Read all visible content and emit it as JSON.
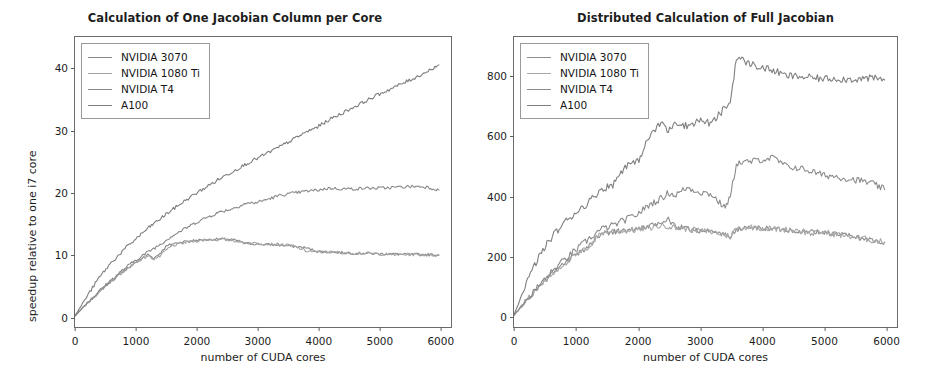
{
  "figure": {
    "background": "#ffffff",
    "panel_count": 2
  },
  "chart_data": [
    {
      "type": "line",
      "panel": "left",
      "title": "Calculation of One Jacobian Column per Core",
      "xlabel": "number of CUDA cores",
      "ylabel": "speedup relative to one i7 core",
      "xlim": [
        0,
        6200
      ],
      "ylim": [
        -1.8,
        45
      ],
      "xticks": [
        0,
        1000,
        2000,
        3000,
        4000,
        5000,
        6000
      ],
      "xticklabels": [
        "0",
        "1000",
        "2000",
        "3000",
        "4000",
        "5000",
        "6000"
      ],
      "yticks": [
        0,
        10,
        20,
        30,
        40
      ],
      "yticklabels": [
        "0",
        "10",
        "20",
        "30",
        "40"
      ],
      "grid": false,
      "legend_position": "upper left",
      "x": [
        0,
        200,
        400,
        600,
        800,
        1000,
        1200,
        1300,
        1400,
        1500,
        1600,
        1800,
        2000,
        2200,
        2400,
        2600,
        2800,
        3000,
        3200,
        3400,
        3600,
        3800,
        4000,
        4200,
        4400,
        4600,
        4800,
        5000,
        5200,
        5400,
        5600,
        5800,
        6000
      ],
      "series": [
        {
          "name": "NVIDIA 3070",
          "color": "#8a8a8a",
          "values": [
            0,
            2.0,
            3.9,
            5.6,
            7.2,
            8.6,
            9.9,
            9.3,
            10.1,
            11.2,
            11.6,
            12.0,
            12.2,
            12.3,
            12.4,
            12.3,
            11.7,
            11.6,
            11.5,
            11.4,
            11.2,
            11.0,
            10.4,
            10.3,
            10.2,
            10.1,
            10.1,
            10.0,
            10.0,
            9.9,
            9.9,
            9.9,
            9.8
          ]
        },
        {
          "name": "NVIDIA 1080 Ti",
          "color": "#a3a3a3",
          "values": [
            0,
            2.0,
            3.9,
            5.6,
            7.2,
            8.6,
            9.7,
            9.2,
            9.6,
            10.6,
            11.3,
            11.8,
            12.1,
            12.3,
            12.3,
            12.2,
            11.8,
            11.7,
            11.6,
            11.5,
            11.3,
            10.5,
            10.3,
            10.3,
            10.2,
            10.1,
            10.1,
            10.0,
            9.9,
            9.9,
            9.9,
            9.8,
            9.8
          ]
        },
        {
          "name": "NVIDIA T4",
          "color": "#898989",
          "values": [
            0,
            2.1,
            4.0,
            5.8,
            7.5,
            9.0,
            10.3,
            10.9,
            11.5,
            12.2,
            12.9,
            14.0,
            15.1,
            16.0,
            16.8,
            17.3,
            18.1,
            18.3,
            18.9,
            19.5,
            19.8,
            20.1,
            20.3,
            20.6,
            20.5,
            20.5,
            20.6,
            20.6,
            20.7,
            20.8,
            20.9,
            20.8,
            20.3
          ]
        },
        {
          "name": "A100",
          "color": "#7e7e7e",
          "values": [
            0,
            3.2,
            6.2,
            8.6,
            10.6,
            12.4,
            14.1,
            14.9,
            15.6,
            16.4,
            17.1,
            18.5,
            19.8,
            21.0,
            22.2,
            23.3,
            24.4,
            25.4,
            26.4,
            27.4,
            28.5,
            29.6,
            30.5,
            31.7,
            32.7,
            33.7,
            34.7,
            35.7,
            36.6,
            37.5,
            38.4,
            39.4,
            40.5
          ]
        }
      ]
    },
    {
      "type": "line",
      "panel": "right",
      "title": "Distributed Calculation of Full Jacobian",
      "xlabel": "number of CUDA cores",
      "ylabel": "speedup relative to one A100 core",
      "xlim": [
        0,
        6200
      ],
      "ylim": [
        -40,
        930
      ],
      "xticks": [
        0,
        1000,
        2000,
        3000,
        4000,
        5000,
        6000
      ],
      "xticklabels": [
        "0",
        "1000",
        "2000",
        "3000",
        "4000",
        "5000",
        "6000"
      ],
      "yticks": [
        0,
        200,
        400,
        600,
        800
      ],
      "yticklabels": [
        "0",
        "200",
        "400",
        "600",
        "800"
      ],
      "grid": false,
      "legend_position": "upper left",
      "x": [
        0,
        200,
        400,
        600,
        800,
        1000,
        1200,
        1400,
        1600,
        1800,
        2000,
        2200,
        2400,
        2500,
        2600,
        2800,
        3000,
        3200,
        3400,
        3500,
        3600,
        3800,
        4000,
        4200,
        4400,
        4600,
        4800,
        5000,
        5200,
        5400,
        5600,
        5800,
        6000
      ],
      "series": [
        {
          "name": "NVIDIA 3070",
          "color": "#8d8d8d",
          "values": [
            0,
            48,
            94,
            134,
            170,
            200,
            228,
            272,
            279,
            283,
            288,
            296,
            310,
            320,
            296,
            290,
            283,
            279,
            270,
            262,
            286,
            292,
            291,
            288,
            287,
            281,
            279,
            276,
            272,
            266,
            258,
            250,
            244
          ]
        },
        {
          "name": "NVIDIA 1080 Ti",
          "color": "#a8a8a8",
          "values": [
            0,
            48,
            94,
            134,
            170,
            200,
            226,
            274,
            281,
            282,
            286,
            292,
            300,
            298,
            292,
            288,
            282,
            278,
            270,
            262,
            290,
            294,
            292,
            288,
            286,
            284,
            272,
            278,
            270,
            264,
            258,
            250,
            244
          ]
        },
        {
          "name": "NVIDIA T4",
          "color": "#8b8b8b",
          "values": [
            0,
            50,
            98,
            142,
            182,
            218,
            252,
            286,
            300,
            318,
            338,
            370,
            392,
            410,
            400,
            426,
            412,
            404,
            360,
            392,
            508,
            512,
            520,
            526,
            498,
            492,
            482,
            468,
            464,
            456,
            450,
            440,
            420
          ]
        },
        {
          "name": "A100",
          "color": "#808080",
          "values": [
            0,
            108,
            194,
            258,
            306,
            344,
            376,
            420,
            436,
            500,
            512,
            600,
            646,
            612,
            648,
            632,
            652,
            640,
            690,
            710,
            862,
            842,
            828,
            818,
            800,
            798,
            794,
            790,
            792,
            788,
            790,
            792,
            786
          ]
        }
      ]
    }
  ],
  "panels": {
    "left": {
      "title": "Calculation of One Jacobian Column per Core",
      "xlabel": "number of CUDA cores",
      "ylabel": "speedup relative to one i7 core",
      "xticklabels": [
        "0",
        "1000",
        "2000",
        "3000",
        "4000",
        "5000",
        "6000"
      ],
      "yticklabels": [
        "0",
        "10",
        "20",
        "30",
        "40"
      ],
      "legend": [
        {
          "label": "NVIDIA 3070",
          "color": "#8a8a8a"
        },
        {
          "label": "NVIDIA 1080 Ti",
          "color": "#a3a3a3"
        },
        {
          "label": "NVIDIA T4",
          "color": "#898989"
        },
        {
          "label": "A100",
          "color": "#7e7e7e"
        }
      ]
    },
    "right": {
      "title": "Distributed Calculation of Full Jacobian",
      "xlabel": "number of CUDA cores",
      "ylabel": "speedup relative to one A100 core",
      "xticklabels": [
        "0",
        "1000",
        "2000",
        "3000",
        "4000",
        "5000",
        "6000"
      ],
      "yticklabels": [
        "0",
        "200",
        "400",
        "600",
        "800"
      ],
      "legend": [
        {
          "label": "NVIDIA 3070",
          "color": "#8d8d8d"
        },
        {
          "label": "NVIDIA 1080 Ti",
          "color": "#a8a8a8"
        },
        {
          "label": "NVIDIA T4",
          "color": "#8b8b8b"
        },
        {
          "label": "A100",
          "color": "#808080"
        }
      ]
    }
  }
}
